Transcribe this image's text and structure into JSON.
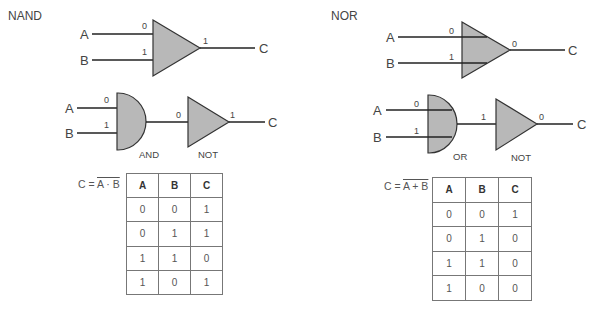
{
  "nand": {
    "title": "NAND",
    "top": {
      "in_a": "A",
      "in_b": "B",
      "out": "C",
      "bit_a": "0",
      "bit_b": "1",
      "bit_out": "1"
    },
    "middle": {
      "in_a": "A",
      "in_b": "B",
      "out": "C",
      "bit_a": "0",
      "bit_b": "1",
      "bit_mid": "0",
      "bit_out": "1",
      "gate1_label": "AND",
      "gate2_label": "NOT"
    },
    "formula": {
      "lhs": "C =",
      "rhs": "A · B"
    },
    "truth_table": {
      "headers": [
        "A",
        "B",
        "C"
      ],
      "rows": [
        [
          "0",
          "0",
          "1"
        ],
        [
          "0",
          "1",
          "1"
        ],
        [
          "1",
          "1",
          "0"
        ],
        [
          "1",
          "0",
          "1"
        ]
      ]
    }
  },
  "nor": {
    "title": "NOR",
    "top": {
      "in_a": "A",
      "in_b": "B",
      "out": "C",
      "bit_a": "0",
      "bit_b": "1",
      "bit_out": "0"
    },
    "middle": {
      "in_a": "A",
      "in_b": "B",
      "out": "C",
      "bit_a": "0",
      "bit_b": "1",
      "bit_mid": "1",
      "bit_out": "0",
      "gate1_label": "OR",
      "gate2_label": "NOT"
    },
    "formula": {
      "lhs": "C =",
      "rhs": "A + B"
    },
    "truth_table": {
      "headers": [
        "A",
        "B",
        "C"
      ],
      "rows": [
        [
          "0",
          "0",
          "1"
        ],
        [
          "0",
          "1",
          "0"
        ],
        [
          "1",
          "1",
          "0"
        ],
        [
          "1",
          "0",
          "0"
        ]
      ]
    }
  },
  "colors": {
    "gate_fill": "#b8b8b8",
    "line": "#222222",
    "text": "#444444"
  }
}
